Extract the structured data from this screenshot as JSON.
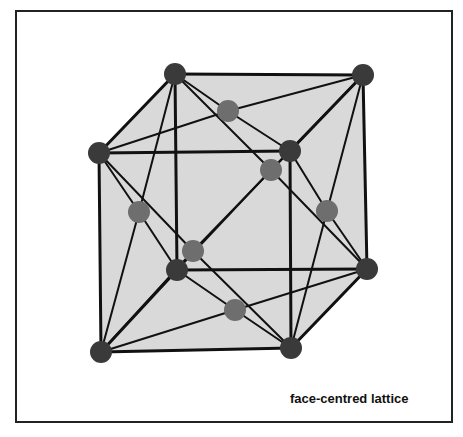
{
  "diagram": {
    "caption": "face-centred lattice",
    "colors": {
      "face_fill": "#d9d9d9",
      "edge": "#111111",
      "corner_atom": "#3a3a3a",
      "face_atom": "#6e6e6e",
      "frame": "#222222"
    },
    "corner_atoms": [
      {
        "id": "tbl",
        "x": 175,
        "y": 74
      },
      {
        "id": "tbr",
        "x": 363,
        "y": 75
      },
      {
        "id": "tfl",
        "x": 99,
        "y": 153
      },
      {
        "id": "tfr",
        "x": 290,
        "y": 151
      },
      {
        "id": "bbl",
        "x": 177,
        "y": 270
      },
      {
        "id": "bbr",
        "x": 367,
        "y": 269
      },
      {
        "id": "bfl",
        "x": 101,
        "y": 352
      },
      {
        "id": "bfr",
        "x": 291,
        "y": 348
      }
    ],
    "face_atoms": [
      {
        "id": "top",
        "x": 228,
        "y": 111
      },
      {
        "id": "back",
        "x": 271,
        "y": 170
      },
      {
        "id": "left",
        "x": 139,
        "y": 212
      },
      {
        "id": "right",
        "x": 327,
        "y": 211
      },
      {
        "id": "front",
        "x": 193,
        "y": 251
      },
      {
        "id": "bottom",
        "x": 235,
        "y": 310
      }
    ]
  }
}
